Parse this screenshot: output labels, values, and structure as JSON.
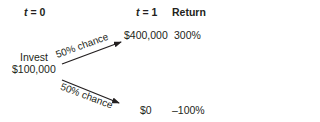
{
  "headers": {
    "t0_var": "t",
    "t0_eq": " = 0",
    "t1_var": "t",
    "t1_eq": " = 1",
    "return": "Return"
  },
  "start": {
    "label": "Invest",
    "amount": "$100,000"
  },
  "outcomes": [
    {
      "probability": "50% chance",
      "value": "$400,000",
      "return": "300%"
    },
    {
      "probability": "50% chance",
      "value": "$0",
      "return": "–100%"
    }
  ],
  "colors": {
    "text": "#231f20",
    "arrow": "#231f20",
    "background": "#ffffff"
  }
}
